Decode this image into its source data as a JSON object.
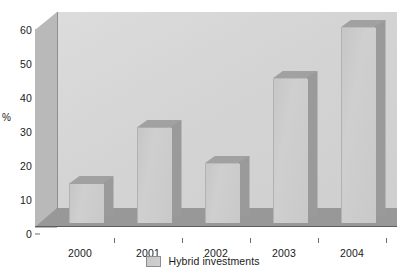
{
  "chart_data": {
    "type": "bar",
    "title": "",
    "xlabel": "",
    "ylabel": "%",
    "categories": [
      "2000",
      "2001",
      "2002",
      "2003",
      "2004"
    ],
    "series": [
      {
        "name": "Hybrid investments",
        "values": [
          11.5,
          28,
          17.5,
          42.5,
          57.5
        ]
      }
    ],
    "values": [
      11.5,
      28,
      17.5,
      42.5,
      57.5
    ],
    "ylim": [
      0,
      60
    ],
    "ytick_labels": [
      "0",
      "10",
      "20",
      "30",
      "40",
      "50",
      "60"
    ],
    "ytick_values": [
      0,
      10,
      20,
      30,
      40,
      50,
      60
    ],
    "grid": false,
    "legend_position": "bottom",
    "style": "3d-column",
    "colors": {
      "bar_face": "#cacaca",
      "bar_side": "#9a9a9a",
      "bar_top": "#a8a8a8",
      "plot_background": "#d6d6d6",
      "floor": "#989898",
      "text": "#1a1a1a"
    }
  },
  "axis": {
    "y_label": "%",
    "y_ticks": [
      "0",
      "10",
      "20",
      "30",
      "40",
      "50",
      "60"
    ],
    "x_ticks": [
      "2000",
      "2001",
      "2002",
      "2003",
      "2004"
    ]
  },
  "legend": {
    "entries": [
      {
        "label": "Hybrid investments",
        "swatch_name": "legend-swatch-hybrid-investments"
      }
    ]
  }
}
